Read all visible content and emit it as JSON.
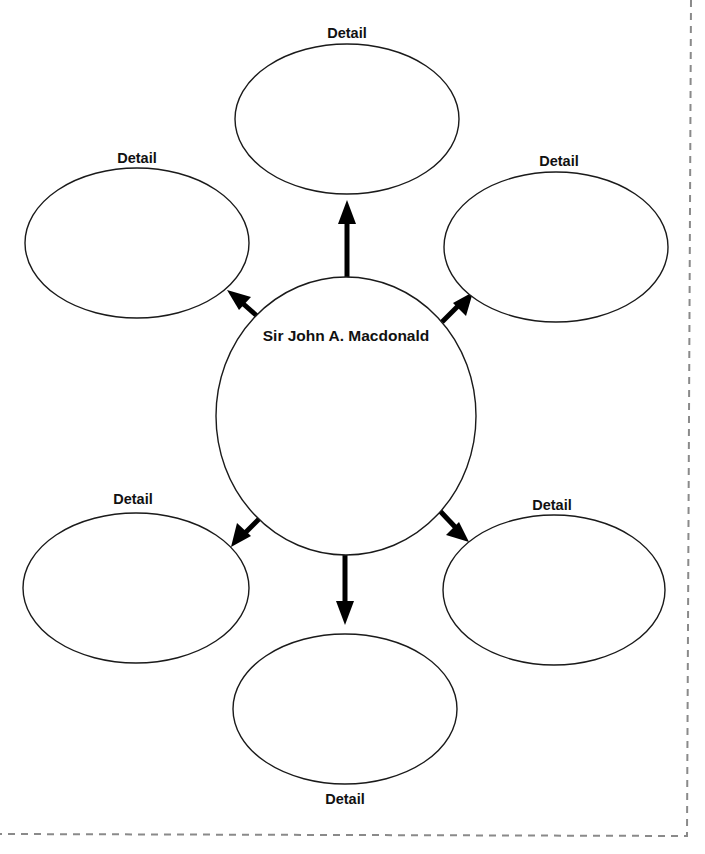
{
  "diagram": {
    "type": "concept-web",
    "central_topic": "Sir John A. Macdonald",
    "details": [
      {
        "id": "top",
        "label": "Detail",
        "text": ""
      },
      {
        "id": "upper-left",
        "label": "Detail",
        "text": ""
      },
      {
        "id": "upper-right",
        "label": "Detail",
        "text": ""
      },
      {
        "id": "lower-left",
        "label": "Detail",
        "text": ""
      },
      {
        "id": "lower-right",
        "label": "Detail",
        "text": ""
      },
      {
        "id": "bottom",
        "label": "Detail",
        "text": ""
      }
    ],
    "connectors": [
      {
        "from": "center",
        "to": "top",
        "style": "arrow"
      },
      {
        "from": "center",
        "to": "upper-left",
        "style": "arrow"
      },
      {
        "from": "center",
        "to": "upper-right",
        "style": "arrow"
      },
      {
        "from": "center",
        "to": "lower-left",
        "style": "arrow"
      },
      {
        "from": "center",
        "to": "lower-right",
        "style": "arrow"
      },
      {
        "from": "center",
        "to": "bottom",
        "style": "arrow"
      }
    ],
    "colors": {
      "stroke": "#1a1a1a",
      "arrow": "#000000",
      "cut_line": "#8a8a8a",
      "background": "#ffffff"
    }
  }
}
